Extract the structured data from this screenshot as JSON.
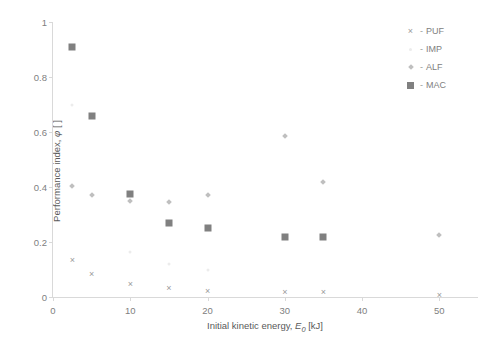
{
  "chart_data": {
    "type": "scatter",
    "title": "",
    "xlabel": "Initial kinetic energy, E_0 [kJ]",
    "ylabel": "Performance index, φ [ ]",
    "xlim": [
      0,
      55
    ],
    "ylim": [
      0,
      1
    ],
    "grid": false,
    "legend_position": "top-right",
    "xticks": [
      0,
      10,
      20,
      30,
      40,
      50
    ],
    "xtick_labels": [
      "0",
      "10",
      "20",
      "30",
      "40",
      "50"
    ],
    "yticks": [
      0,
      0.2,
      0.4,
      0.6,
      0.8,
      1
    ],
    "ytick_labels": [
      "0",
      "0.2",
      "0.4",
      "0.6",
      "0.8",
      "1"
    ],
    "series": [
      {
        "name": "PUF",
        "marker": "cross",
        "color": "#9a9a9a",
        "points": [
          {
            "x": 2.5,
            "y": 0.13
          },
          {
            "x": 5,
            "y": 0.08
          },
          {
            "x": 10,
            "y": 0.045
          },
          {
            "x": 15,
            "y": 0.03
          },
          {
            "x": 20,
            "y": 0.02
          },
          {
            "x": 30,
            "y": 0.015
          },
          {
            "x": 35,
            "y": 0.015
          },
          {
            "x": 50,
            "y": 0.005
          }
        ]
      },
      {
        "name": "IMP",
        "marker": "dot",
        "color": "#ececec",
        "points": [
          {
            "x": 2.5,
            "y": 0.7
          },
          {
            "x": 10,
            "y": 0.165
          },
          {
            "x": 15,
            "y": 0.12
          },
          {
            "x": 20,
            "y": 0.1
          }
        ]
      },
      {
        "name": "ALF",
        "marker": "diamond",
        "color": "#bfbfbf",
        "points": [
          {
            "x": 2.5,
            "y": 0.405
          },
          {
            "x": 5,
            "y": 0.37
          },
          {
            "x": 10,
            "y": 0.35
          },
          {
            "x": 15,
            "y": 0.345
          },
          {
            "x": 20,
            "y": 0.37
          },
          {
            "x": 30,
            "y": 0.585
          },
          {
            "x": 35,
            "y": 0.42
          },
          {
            "x": 50,
            "y": 0.225
          }
        ]
      },
      {
        "name": "MAC",
        "marker": "square",
        "color": "#808080",
        "points": [
          {
            "x": 2.5,
            "y": 0.91
          },
          {
            "x": 5,
            "y": 0.66
          },
          {
            "x": 10,
            "y": 0.375
          },
          {
            "x": 15,
            "y": 0.27
          },
          {
            "x": 20,
            "y": 0.25
          },
          {
            "x": 30,
            "y": 0.22
          },
          {
            "x": 35,
            "y": 0.22
          }
        ]
      }
    ]
  },
  "axes": {
    "y_title_main": "Performance index, ",
    "y_title_symbol": "φ",
    "y_title_unit": " [ ]",
    "x_title_main": "Initial kinetic energy, ",
    "x_title_symbol": "E",
    "x_title_sub": "0",
    "x_title_unit": " [kJ]"
  },
  "legend": {
    "separator": "-",
    "entries": [
      {
        "label": "PUF",
        "glyph": "×",
        "marker": "cross-marker"
      },
      {
        "label": "IMP",
        "glyph": "",
        "marker": "dot-marker"
      },
      {
        "label": "ALF",
        "glyph": "",
        "marker": "diamond-marker"
      },
      {
        "label": "MAC",
        "glyph": "",
        "marker": "square-marker"
      }
    ]
  }
}
